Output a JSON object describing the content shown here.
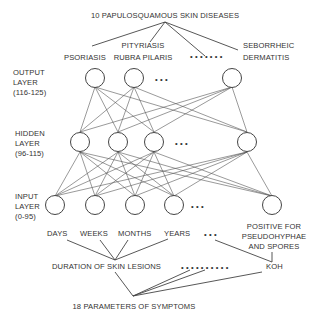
{
  "title_top": "10 PAPULOSQUAMOUS SKIN DISEASES",
  "diseases": {
    "psoriasis": "PSORIASIS",
    "prp_line1": "PITYRIASIS",
    "prp_line2": "RUBRA PILARIS",
    "seb_line1": "SEBORRHEIC",
    "seb_line2": "DERMATITIS",
    "ellipsis": "• • • • • • •"
  },
  "layers": {
    "output": {
      "line1": "OUTPUT",
      "line2": "LAYER",
      "range": "(116-125)"
    },
    "hidden": {
      "line1": "HIDDEN",
      "line2": "LAYER",
      "range": "(96-115)"
    },
    "input": {
      "line1": "INPUT",
      "line2": "LAYER",
      "range": "(0-95)"
    }
  },
  "layer_ellipsis": "• • •",
  "inputs": {
    "days": "DAYS",
    "weeks": "WEEKS",
    "months": "MONTHS",
    "years": "YEARS",
    "ellipsis": "• • •",
    "koh_line1": "POSITIVE FOR",
    "koh_line2": "PSEUDOHYPHAE",
    "koh_line3": "AND SPORES"
  },
  "symptoms": {
    "duration": "DURATION OF SKIN LESIONS",
    "ellipsis": "• • • • • • • • • •",
    "koh": "KOH",
    "title_bottom": "18 PARAMETERS OF SYMPTOMS"
  },
  "colors": {
    "line": "#444444",
    "text": "#333333",
    "background": "#ffffff"
  }
}
